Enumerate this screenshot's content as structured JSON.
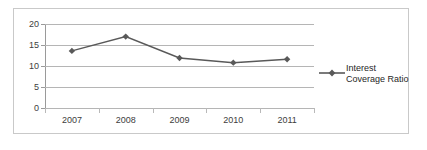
{
  "chart_data": {
    "type": "line",
    "title": "",
    "xlabel": "",
    "ylabel": "",
    "categories": [
      "2007",
      "2008",
      "2009",
      "2010",
      "2011"
    ],
    "series": [
      {
        "name": "Interest Coverage Ratio",
        "values": [
          13.6,
          17.0,
          11.9,
          10.8,
          11.6
        ],
        "color": "#595959",
        "marker": "diamond"
      }
    ],
    "ylim": [
      0,
      20
    ],
    "yticks": [
      0,
      5,
      10,
      15,
      20
    ],
    "ytick_labels": [
      "0",
      "5",
      "10",
      "15",
      "20"
    ],
    "grid": true,
    "grid_color": "#b5b5b5",
    "legend_position": "right",
    "legend_entries": [
      "Interest Coverage Ratio"
    ],
    "legend_line1": "Interest",
    "legend_line2": "Coverage Ratio",
    "border_color": "#c9c9c9",
    "background": "#ffffff"
  }
}
